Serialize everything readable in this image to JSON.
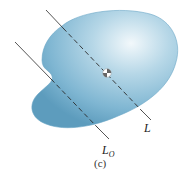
{
  "figure": {
    "caption": "(c)",
    "labels": {
      "axis_L": "L",
      "axis_LO_main": "L",
      "axis_LO_sub": "O"
    },
    "colors": {
      "body_fill": "#7fb6d2",
      "body_highlight": "#eaf4f9",
      "body_edge": "#5d9cbd",
      "line": "#2a2a2a"
    },
    "elements": {
      "body": "rigid body (blob)",
      "centroid": "center of mass marker",
      "axis_L": "axis through center of mass",
      "axis_LO": "parallel axis"
    }
  }
}
